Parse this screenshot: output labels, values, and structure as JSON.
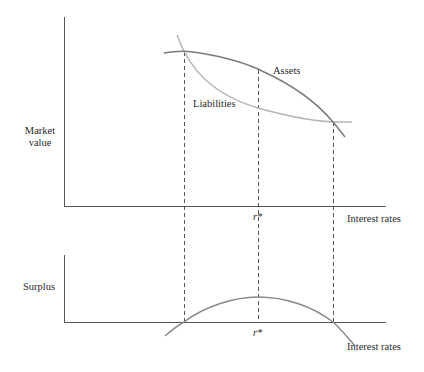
{
  "top_panel": {
    "y_label_line1": "Market",
    "y_label_line2": "value",
    "x_label": "Interest rates",
    "r_star_label": "r*",
    "curves": {
      "assets_label": "Assets",
      "liabilities_label": "Liabilities"
    }
  },
  "bottom_panel": {
    "y_label": "Surplus",
    "x_label": "Interest rates",
    "r_star_label": "r*"
  },
  "colors": {
    "axis": "#555555",
    "assets_curve": "#7a7a7a",
    "liabilities_curve": "#b5b5b5",
    "surplus_curve": "#8a8a8a",
    "dashed_guides": "#444444",
    "text": "#2a2a2a"
  }
}
